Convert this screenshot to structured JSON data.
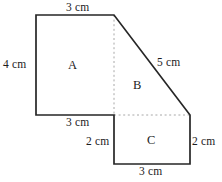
{
  "figure": {
    "unit": "cm",
    "stroke_color": "#262626",
    "dashed_color": "#a8a8a8",
    "background_color": "#ffffff",
    "regions": [
      {
        "id": "A",
        "label": "A",
        "shape": "rectangle",
        "width_cm": 3,
        "height_cm": 4
      },
      {
        "id": "B",
        "label": "B",
        "shape": "right-triangle",
        "base_cm": 3,
        "height_cm": 4,
        "hypotenuse_cm": 5
      },
      {
        "id": "C",
        "label": "C",
        "shape": "rectangle",
        "width_cm": 3,
        "height_cm": 2
      }
    ],
    "dimensions": {
      "top_3cm": "3 cm",
      "left_4cm": "4 cm",
      "hypotenuse_5cm": "5 cm",
      "middle_bottom_3cm": "3 cm",
      "left_2cm": "2 cm",
      "right_2cm": "2 cm",
      "bottom_3cm": "3 cm"
    },
    "geometry": {
      "outline_points": "36,15 114,15 190,115 190,164 114,164 114,115 36,115",
      "dashed_vertical": {
        "x1": 114,
        "y1": 15,
        "x2": 114,
        "y2": 115
      },
      "dashed_horizontal": {
        "x1": 114,
        "y1": 115,
        "x2": 190,
        "y2": 115
      }
    }
  }
}
